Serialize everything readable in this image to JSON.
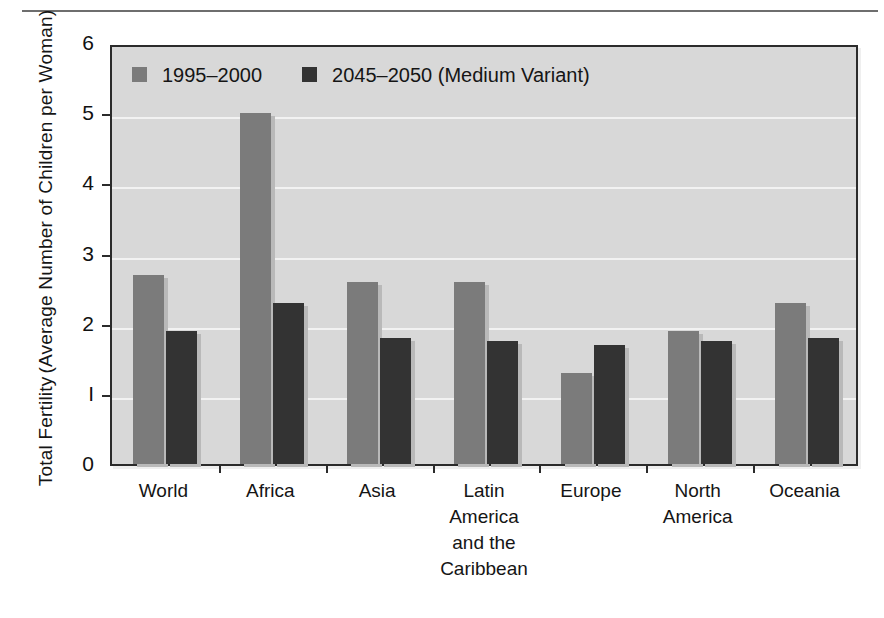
{
  "chart_data": {
    "type": "bar",
    "title": "",
    "xlabel": "",
    "ylabel_line1": "Total Fertility",
    "ylabel_line2": "(Average Number of Children per Woman)",
    "categories": [
      [
        "World"
      ],
      [
        "Africa"
      ],
      [
        "Asia"
      ],
      [
        "Latin",
        "America",
        "and the",
        "Caribbean"
      ],
      [
        "Europe"
      ],
      [
        "North",
        "America"
      ],
      [
        "Oceania"
      ]
    ],
    "series": [
      {
        "name": "1995–2000",
        "color": "#7b7b7b",
        "values": [
          2.7,
          5.0,
          2.6,
          2.6,
          1.3,
          1.9,
          2.3
        ]
      },
      {
        "name": "2045–2050 (Medium Variant)",
        "color": "#333333",
        "values": [
          1.9,
          2.3,
          1.8,
          1.75,
          1.7,
          1.75,
          1.8
        ]
      }
    ],
    "ylim": [
      0,
      6
    ],
    "yticks": [
      0,
      1,
      2,
      3,
      4,
      5,
      6
    ],
    "ytick_labels": [
      "0",
      "I",
      "2",
      "3",
      "4",
      "5",
      "6"
    ],
    "grid": true,
    "gridlines_at": [
      1,
      2,
      3,
      4,
      5
    ],
    "legend_position": "top-left",
    "plot_background": "#d8d8d8",
    "gridline_color": "#f2f2f2",
    "axis_color": "#2b2b2b"
  }
}
